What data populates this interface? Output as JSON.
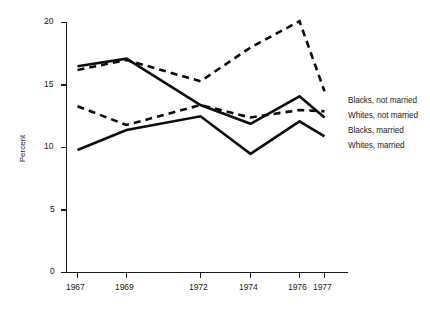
{
  "chart_data": {
    "type": "line",
    "title": "",
    "subtitle": "",
    "xlabel": "",
    "ylabel": "Percent",
    "x": [
      "1967",
      "1969",
      "1972",
      "1974",
      "1976",
      "1977"
    ],
    "x_tick_labels": [
      "1967",
      "1969",
      "1972",
      "1974",
      "1976",
      "1977"
    ],
    "y_tick_labels": [
      "0",
      "5",
      "10",
      "15",
      "20"
    ],
    "y_ticks": [
      0,
      5,
      10,
      15,
      20
    ],
    "ylim": [
      0,
      20
    ],
    "grid": false,
    "legend_position": "right",
    "series": [
      {
        "name": "Blacks, not married",
        "style": "dashed",
        "values": [
          16.2,
          17.0,
          15.3,
          18.0,
          20.1,
          14.5
        ]
      },
      {
        "name": "Whites, not married",
        "style": "dashed",
        "values": [
          13.3,
          11.8,
          13.4,
          12.4,
          13.0,
          12.9
        ]
      },
      {
        "name": "Blacks, married",
        "style": "solid",
        "values": [
          16.5,
          17.1,
          13.4,
          11.9,
          14.1,
          12.4
        ]
      },
      {
        "name": "Whites, married",
        "style": "solid",
        "values": [
          9.8,
          11.4,
          12.5,
          9.5,
          12.1,
          10.9
        ]
      }
    ]
  },
  "legend": {
    "entries": [
      "Blacks, not married",
      "Whites, not married",
      "Blacks, married",
      "Whites, married"
    ]
  },
  "colors": {
    "ink": "#0d0d0d",
    "axis": "#1a1a1a",
    "background": "#ffffff"
  }
}
